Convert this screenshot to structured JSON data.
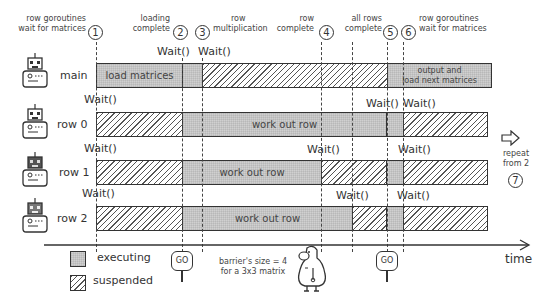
{
  "annotations": [
    {
      "id": "1",
      "text_lines": [
        "row goroutines",
        "wait for matrices"
      ]
    },
    {
      "id": "2",
      "text_lines": [
        "loading",
        "complete"
      ]
    },
    {
      "id": "3",
      "text_lines": [
        "row",
        "multiplication"
      ]
    },
    {
      "id": "4",
      "text_lines": [
        "row",
        "complete"
      ]
    },
    {
      "id": "5",
      "text_lines": [
        "all rows",
        "complete"
      ]
    },
    {
      "id": "6",
      "text_lines": [
        "row goroutines",
        "wait for matrices"
      ]
    },
    {
      "id": "7",
      "text_lines": [
        "repeat",
        "from 2"
      ]
    }
  ],
  "wait_label": "Wait()",
  "rows": [
    {
      "label": "main",
      "segments": [
        {
          "state": "executing",
          "text": "load matrices"
        },
        {
          "state": "executing",
          "text": ""
        },
        {
          "state": "suspended",
          "text": ""
        },
        {
          "state": "executing",
          "text_lines": [
            "output and",
            "load next matrices"
          ]
        }
      ]
    },
    {
      "label": "row 0",
      "segments": [
        {
          "state": "suspended",
          "text": ""
        },
        {
          "state": "executing",
          "text": "work out row"
        },
        {
          "state": "executing",
          "text": ""
        },
        {
          "state": "suspended",
          "text": ""
        }
      ]
    },
    {
      "label": "row 1",
      "segments": [
        {
          "state": "suspended",
          "text": ""
        },
        {
          "state": "executing",
          "text": "work out row"
        },
        {
          "state": "suspended",
          "text": ""
        },
        {
          "state": "executing",
          "text": ""
        },
        {
          "state": "suspended",
          "text": ""
        }
      ]
    },
    {
      "label": "row 2",
      "segments": [
        {
          "state": "suspended",
          "text": ""
        },
        {
          "state": "executing",
          "text": "work out row"
        },
        {
          "state": "suspended",
          "text": ""
        },
        {
          "state": "executing",
          "text": ""
        },
        {
          "state": "suspended",
          "text": ""
        }
      ]
    }
  ],
  "legend": {
    "executing": "executing",
    "suspended": "suspended"
  },
  "go_sign": "GO",
  "barrier_note": [
    "barrier's size = 4",
    "for a 3x3 matrix"
  ],
  "axis_label": "time",
  "colors": {
    "executing": "#d0d0d0",
    "suspended_hatch": "#555555",
    "ink": "#333333"
  }
}
